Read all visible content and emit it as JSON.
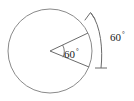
{
  "figure": {
    "background_color": "#ffffff",
    "stroke_color": "#6b6b6b",
    "text_color": "#1a1a1a",
    "circle": {
      "center_x": 50,
      "center_y": 51,
      "radius": 42
    },
    "sector": {
      "angle_value": "60",
      "degree_symbol": "°",
      "start_angle_deg": 25,
      "end_angle_deg": -22,
      "label_x": 68,
      "label_y": 55
    },
    "external_arc": {
      "angle_value": "60",
      "degree_symbol": "°",
      "label_x": 112,
      "label_y": 38,
      "has_arrowhead": true,
      "arrowhead_position": "top",
      "has_end_tick": true,
      "end_tick_position": "bottom"
    }
  }
}
